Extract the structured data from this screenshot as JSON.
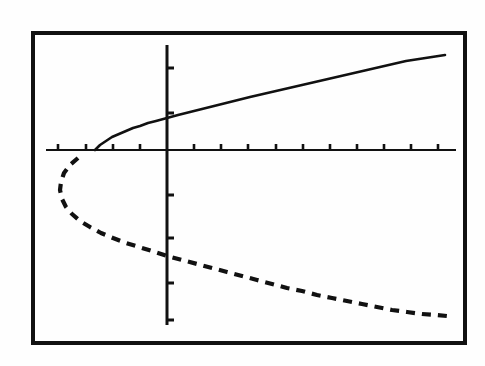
{
  "figure": {
    "title": "",
    "background_color": "#fefefe",
    "ink_color": "#111111",
    "frame": {
      "name": "calculator-screen-border",
      "x": 31,
      "y": 31,
      "width": 436,
      "height": 314,
      "stroke_width": 4,
      "stroke_color": "#111111"
    }
  },
  "axes": {
    "x_axis": {
      "label": "",
      "y_pixel": 150,
      "x_start_pixel": 46,
      "x_end_pixel": 456,
      "stroke_width": 2,
      "tick_spacing_pixels": 27.3,
      "tick_length": 6,
      "tick_count": 15,
      "tick_labels": []
    },
    "y_axis": {
      "label": "",
      "x_pixel": 167,
      "y_start_pixel": 45,
      "y_end_pixel": 325,
      "stroke_width": 3,
      "tick_spacing_pixels": 45,
      "tick_length": 7,
      "tick_count": 6,
      "tick_labels": []
    },
    "origin": {
      "x": 167,
      "y": 150
    },
    "x_range": [
      -4.5,
      10.6
    ],
    "y_range": [
      -2.4,
      2.4
    ],
    "x_scale_pixels_per_unit": 27.3,
    "y_scale_pixels_per_unit": 45,
    "grid": false
  },
  "chart_data": {
    "type": "line",
    "title": "",
    "subtitle": "",
    "xlabel": "",
    "ylabel": "",
    "xlim": [
      -4.5,
      10.6
    ],
    "ylim": [
      -2.4,
      2.4
    ],
    "grid": false,
    "legend": "none",
    "annotations": [],
    "series": [
      {
        "name": "upper-branch",
        "style": "solid",
        "stroke_width": 2.6,
        "color": "#111111",
        "points_pixels": [
          [
            95,
            150
          ],
          [
            100,
            145
          ],
          [
            106,
            141
          ],
          [
            112,
            137
          ],
          [
            119,
            134
          ],
          [
            126,
            131
          ],
          [
            133,
            128
          ],
          [
            140,
            126
          ],
          [
            148,
            123
          ],
          [
            156,
            121
          ],
          [
            167,
            118
          ],
          [
            178,
            115
          ],
          [
            190,
            112
          ],
          [
            202,
            109
          ],
          [
            214,
            106
          ],
          [
            226,
            103
          ],
          [
            238,
            100
          ],
          [
            250,
            97
          ],
          [
            263,
            94
          ],
          [
            276,
            91
          ],
          [
            289,
            88
          ],
          [
            302,
            85
          ],
          [
            315,
            82
          ],
          [
            328,
            79
          ],
          [
            341,
            76
          ],
          [
            354,
            73
          ],
          [
            367,
            70
          ],
          [
            380,
            67
          ],
          [
            393,
            64
          ],
          [
            406,
            61
          ],
          [
            419,
            59
          ],
          [
            432,
            57
          ],
          [
            445,
            55
          ]
        ]
      },
      {
        "name": "lower-branch",
        "style": "dashed",
        "dash_pattern": "9 7",
        "stroke_width": 4.2,
        "color": "#111111",
        "points_pixels": [
          [
            78,
            158
          ],
          [
            70,
            165
          ],
          [
            64,
            173
          ],
          [
            61,
            182
          ],
          [
            60,
            190
          ],
          [
            62,
            199
          ],
          [
            66,
            207
          ],
          [
            72,
            214
          ],
          [
            80,
            221
          ],
          [
            90,
            227
          ],
          [
            101,
            233
          ],
          [
            113,
            238
          ],
          [
            126,
            243
          ],
          [
            139,
            247
          ],
          [
            152,
            251
          ],
          [
            167,
            256
          ],
          [
            182,
            260
          ],
          [
            197,
            264
          ],
          [
            212,
            268
          ],
          [
            227,
            272
          ],
          [
            242,
            276
          ],
          [
            257,
            280
          ],
          [
            272,
            284
          ],
          [
            287,
            288
          ],
          [
            302,
            291
          ],
          [
            317,
            295
          ],
          [
            332,
            298
          ],
          [
            347,
            301
          ],
          [
            362,
            304
          ],
          [
            377,
            307
          ],
          [
            392,
            310
          ],
          [
            407,
            312
          ],
          [
            422,
            314
          ],
          [
            437,
            315
          ],
          [
            447,
            316
          ]
        ]
      }
    ]
  },
  "ticks": {
    "x_tick_pixels": [
      58,
      86,
      113,
      140,
      194,
      221,
      248,
      276,
      303,
      330,
      357,
      384,
      411,
      438
    ],
    "y_tick_pixels": [
      68,
      113,
      195,
      238,
      283,
      320
    ]
  }
}
